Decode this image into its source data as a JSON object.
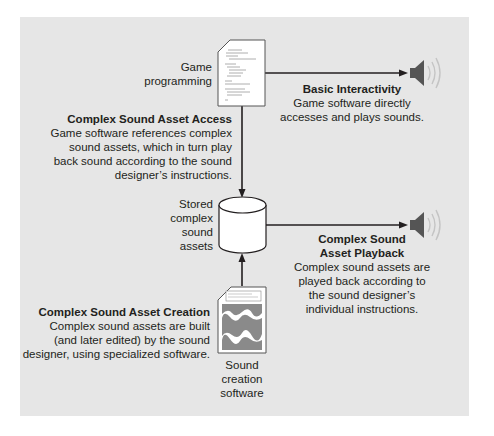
{
  "diagram": {
    "nodes": {
      "game_programming": {
        "label_lines": [
          "Game",
          "programming"
        ]
      },
      "stored_assets": {
        "label_lines": [
          "Stored",
          "complex",
          "sound",
          "assets"
        ]
      },
      "sound_creation": {
        "label_lines": [
          "Sound",
          "creation",
          "software"
        ]
      }
    },
    "annotations": {
      "basic_interactivity": {
        "title": "Basic Interactivity",
        "body_lines": [
          "Game software directly",
          "accesses and plays sounds."
        ]
      },
      "asset_access": {
        "title": "Complex Sound Asset Access",
        "body_lines": [
          "Game software references complex",
          "sound assets, which in turn play",
          "back sound according to the sound",
          "designer’s instructions."
        ]
      },
      "asset_playback": {
        "title_lines": [
          "Complex Sound",
          "Asset Playback"
        ],
        "body_lines": [
          "Complex sound assets are",
          "played back according to",
          "the sound designer’s",
          "individual instructions."
        ]
      },
      "asset_creation": {
        "title": "Complex Sound Asset Creation",
        "body_lines": [
          "Complex sound assets are built",
          "(and later edited) by the sound",
          "designer, using specialized software."
        ]
      }
    },
    "icons": {
      "top_speaker": "speaker-icon",
      "bottom_speaker": "speaker-icon",
      "code_document": "code-document-icon",
      "database": "database-cylinder-icon",
      "waveform_document": "waveform-document-icon"
    },
    "colors": {
      "panel": "#e6e6e6",
      "line": "#231f20",
      "speaker": "#555555",
      "waveform": "#8a8a8a"
    }
  }
}
